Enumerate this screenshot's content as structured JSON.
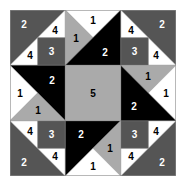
{
  "colors": {
    "1": "#ffffff",
    "2": "#000000",
    "3": "#555555",
    "4": "#ffffff",
    "5": "#aaaaaa",
    "dark": "#555555",
    "light": "#aaaaaa",
    "black": "#000000",
    "white": "#ffffff",
    "border": "#888888"
  },
  "pieces": [
    {
      "id": "tl-big",
      "pts": "0,0 55.3,0 0,55.3",
      "fill": "#555555",
      "label": "2",
      "lx": 14,
      "ly": 14,
      "lc": "#ffffff"
    },
    {
      "id": "tl-w1",
      "pts": "55.3,0 27.7,27.7 55.3,27.7",
      "fill": "#ffffff",
      "label": "4",
      "lx": 45,
      "ly": 20,
      "lc": "#000000"
    },
    {
      "id": "tl-w2",
      "pts": "0,55.3 27.7,27.7 27.7,55.3",
      "fill": "#ffffff",
      "label": "4",
      "lx": 20,
      "ly": 45,
      "lc": "#000000"
    },
    {
      "id": "tl-sq",
      "pts": "27.7,27.7 55.3,27.7 55.3,55.3 27.7,55.3",
      "fill": "#555555",
      "label": "3",
      "lx": 41.5,
      "ly": 41.5,
      "lc": "#ffffff"
    },
    {
      "id": "tr-big",
      "pts": "166,0 110.7,0 166,55.3",
      "fill": "#555555",
      "label": "2",
      "lx": 152,
      "ly": 14,
      "lc": "#ffffff"
    },
    {
      "id": "tr-w1",
      "pts": "110.7,0 138.3,27.7 110.7,27.7",
      "fill": "#ffffff",
      "label": "4",
      "lx": 121,
      "ly": 20,
      "lc": "#000000"
    },
    {
      "id": "tr-w2",
      "pts": "166,55.3 138.3,27.7 138.3,55.3",
      "fill": "#ffffff",
      "label": "4",
      "lx": 146,
      "ly": 45,
      "lc": "#000000"
    },
    {
      "id": "tr-sq",
      "pts": "110.7,27.7 138.3,27.7 138.3,55.3 110.7,55.3",
      "fill": "#555555",
      "label": "3",
      "lx": 124.5,
      "ly": 41.5,
      "lc": "#ffffff"
    },
    {
      "id": "bl-big",
      "pts": "0,166 0,110.7 55.3,166",
      "fill": "#555555",
      "label": "2",
      "lx": 14,
      "ly": 152,
      "lc": "#ffffff"
    },
    {
      "id": "bl-w1",
      "pts": "0,110.7 27.7,138.3 27.7,110.7",
      "fill": "#ffffff",
      "label": "4",
      "lx": 20,
      "ly": 121,
      "lc": "#000000"
    },
    {
      "id": "bl-w2",
      "pts": "55.3,166 27.7,138.3 55.3,138.3",
      "fill": "#ffffff",
      "label": "4",
      "lx": 45,
      "ly": 146,
      "lc": "#000000"
    },
    {
      "id": "bl-sq",
      "pts": "27.7,110.7 55.3,110.7 55.3,138.3 27.7,138.3",
      "fill": "#555555",
      "label": "3",
      "lx": 41.5,
      "ly": 124.5,
      "lc": "#ffffff"
    },
    {
      "id": "br-big",
      "pts": "166,166 166,110.7 110.7,166",
      "fill": "#555555",
      "label": "2",
      "lx": 152,
      "ly": 152,
      "lc": "#ffffff"
    },
    {
      "id": "br-w1",
      "pts": "166,110.7 138.3,138.3 138.3,110.7",
      "fill": "#ffffff",
      "label": "4",
      "lx": 146,
      "ly": 121,
      "lc": "#000000"
    },
    {
      "id": "br-w2",
      "pts": "110.7,166 138.3,138.3 110.7,138.3",
      "fill": "#ffffff",
      "label": "4",
      "lx": 121,
      "ly": 146,
      "lc": "#000000"
    },
    {
      "id": "br-sq",
      "pts": "110.7,110.7 138.3,110.7 138.3,138.3 110.7,138.3",
      "fill": "#555555",
      "label": "3",
      "lx": 124.5,
      "ly": 124.5,
      "lc": "#ffffff"
    },
    {
      "id": "t-white",
      "pts": "55.3,0 110.7,0 83,27.7",
      "fill": "#ffffff",
      "label": "1",
      "lx": 83,
      "ly": 10,
      "lc": "#000000"
    },
    {
      "id": "t-gray",
      "pts": "55.3,0 83,27.7 55.3,55.3",
      "fill": "#aaaaaa",
      "label": "1",
      "lx": 66,
      "ly": 28,
      "lc": "#000000"
    },
    {
      "id": "t-black",
      "pts": "110.7,0 55.3,55.3 110.7,55.3",
      "fill": "#000000",
      "label": "2",
      "lx": 95,
      "ly": 42,
      "lc": "#ffffff"
    },
    {
      "id": "r-gray",
      "pts": "110.7,55.3 166,55.3 138.3,83",
      "fill": "#aaaaaa",
      "label": "1",
      "lx": 138,
      "ly": 66,
      "lc": "#000000"
    },
    {
      "id": "r-white",
      "pts": "166,55.3 166,110.7 138.3,83",
      "fill": "#ffffff",
      "label": "1",
      "lx": 156,
      "ly": 83,
      "lc": "#000000"
    },
    {
      "id": "r-black",
      "pts": "110.7,55.3 166,110.7 110.7,110.7",
      "fill": "#000000",
      "label": "2",
      "lx": 124,
      "ly": 96,
      "lc": "#ffffff"
    },
    {
      "id": "b-black",
      "pts": "55.3,110.7 110.7,110.7 55.3,166",
      "fill": "#000000",
      "label": "2",
      "lx": 71,
      "ly": 124,
      "lc": "#ffffff"
    },
    {
      "id": "b-gray",
      "pts": "110.7,110.7 110.7,166 83,138.3",
      "fill": "#aaaaaa",
      "label": "1",
      "lx": 100,
      "ly": 138,
      "lc": "#000000"
    },
    {
      "id": "b-white",
      "pts": "55.3,166 110.7,166 83,138.3",
      "fill": "#ffffff",
      "label": "1",
      "lx": 83,
      "ly": 156,
      "lc": "#000000"
    },
    {
      "id": "l-black",
      "pts": "0,55.3 55.3,55.3 55.3,110.7",
      "fill": "#000000",
      "label": "2",
      "lx": 42,
      "ly": 70,
      "lc": "#ffffff"
    },
    {
      "id": "l-white",
      "pts": "0,55.3 27.7,83 0,110.7",
      "fill": "#ffffff",
      "label": "1",
      "lx": 10,
      "ly": 83,
      "lc": "#000000"
    },
    {
      "id": "l-gray",
      "pts": "0,110.7 27.7,83 55.3,110.7",
      "fill": "#aaaaaa",
      "label": "1",
      "lx": 28,
      "ly": 100,
      "lc": "#000000"
    },
    {
      "id": "center",
      "pts": "55.3,55.3 110.7,55.3 110.7,110.7 55.3,110.7",
      "fill": "#aaaaaa",
      "label": "5",
      "lx": 83,
      "ly": 83,
      "lc": "#000000"
    }
  ]
}
